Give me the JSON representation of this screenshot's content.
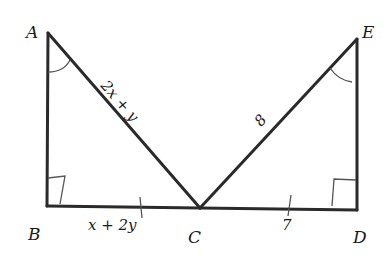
{
  "diagram": {
    "type": "geometry",
    "points": {
      "A": {
        "label": "A",
        "x": 48,
        "y": 33
      },
      "B": {
        "label": "B",
        "x": 47,
        "y": 206
      },
      "C": {
        "label": "C",
        "x": 200,
        "y": 208
      },
      "D": {
        "label": "D",
        "x": 357,
        "y": 210
      },
      "E": {
        "label": "E",
        "x": 357,
        "y": 39
      }
    },
    "segment_labels": {
      "AC": "2x + y",
      "BC": "x + 2y",
      "CE": "8",
      "CD": "7"
    },
    "right_angles": [
      "B",
      "D"
    ],
    "congruent_angles": [
      "A",
      "E"
    ],
    "tick_marks": [
      "BC",
      "CD"
    ],
    "colors": {
      "line": "#2a2a2a",
      "mark": "#555555",
      "background": "#ffffff"
    }
  }
}
